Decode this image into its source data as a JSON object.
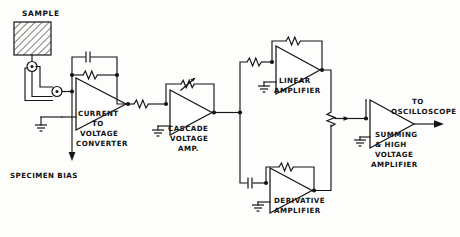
{
  "diagram": {
    "background_color": "#fdfdfc",
    "ink_color": "#151515",
    "labels": {
      "sample": "SAMPLE",
      "specimen_bias": "SPECIMEN  BIAS",
      "current_to_voltage_converter": [
        "CURRENT",
        "TO",
        "VOLTAGE",
        "CONVERTER"
      ],
      "cascade_voltage_amp": [
        "CASCADE",
        "VOLTAGE",
        "AMP."
      ],
      "linear_amplifier": [
        "LINEAR",
        "AMPLIFIER"
      ],
      "derivative_amplifier": [
        "DERIVATIVE",
        "AMPLIFIER"
      ],
      "summing_high_voltage_amplifier": [
        "SUMMING",
        "&  HIGH",
        "VOLTAGE",
        "AMPLIFIER"
      ],
      "to_oscilloscope": [
        "TO",
        "OSCILLOSCOPE"
      ]
    },
    "blocks": [
      {
        "id": "sample",
        "name": "Sample",
        "type": "hatched-specimen"
      },
      {
        "id": "current-to-voltage-converter",
        "name": "Current to Voltage Converter",
        "type": "op-amp"
      },
      {
        "id": "cascade-voltage-amp",
        "name": "Cascade Voltage Amp.",
        "type": "op-amp"
      },
      {
        "id": "linear-amplifier",
        "name": "Linear Amplifier",
        "type": "op-amp"
      },
      {
        "id": "derivative-amplifier",
        "name": "Derivative Amplifier",
        "type": "op-amp"
      },
      {
        "id": "summing-high-voltage-amplifier",
        "name": "Summing & High Voltage Amplifier",
        "type": "op-amp"
      }
    ],
    "components": [
      {
        "id": "feedback-capacitor-1",
        "type": "capacitor",
        "stage": "current-to-voltage-converter"
      },
      {
        "id": "feedback-resistor-1",
        "type": "resistor",
        "stage": "current-to-voltage-converter"
      },
      {
        "id": "series-resistor-1",
        "type": "resistor",
        "stage": "cascade-voltage-amp-input"
      },
      {
        "id": "feedback-potentiometer-cascade",
        "type": "variable-resistor",
        "stage": "cascade-voltage-amp"
      },
      {
        "id": "series-resistor-linear",
        "type": "resistor",
        "stage": "linear-amplifier-input"
      },
      {
        "id": "feedback-resistor-linear",
        "type": "resistor",
        "stage": "linear-amplifier"
      },
      {
        "id": "coupling-capacitor-derivative",
        "type": "capacitor",
        "stage": "derivative-amplifier-input"
      },
      {
        "id": "feedback-resistor-derivative",
        "type": "resistor",
        "stage": "derivative-amplifier"
      },
      {
        "id": "gain-potentiometer-linear",
        "type": "potentiometer",
        "stage": "linear-amplifier-output"
      },
      {
        "id": "gain-potentiometer-summing",
        "type": "potentiometer",
        "stage": "summing-input"
      },
      {
        "id": "connector-upper",
        "type": "coaxial-connector",
        "stage": "sample"
      },
      {
        "id": "connector-lower",
        "type": "coaxial-connector",
        "stage": "sample"
      }
    ],
    "grounds": [
      "ground-input-stage",
      "ground-cascade",
      "ground-post-cascade",
      "ground-linear",
      "ground-derivative",
      "ground-pot",
      "ground-summing"
    ]
  }
}
